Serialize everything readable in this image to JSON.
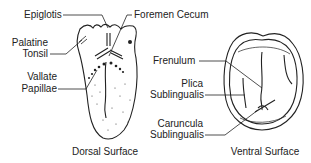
{
  "dorsal": {
    "caption": "Dorsal Surface",
    "labels": {
      "epiglotis": "Epiglotis",
      "foremen_cecum": "Foremen Cecum",
      "palatine_1": "Palatine",
      "palatine_2": "Tonsil",
      "vallate_1": "Vallate",
      "vallate_2": "Papillae"
    }
  },
  "ventral": {
    "caption": "Ventral Surface",
    "labels": {
      "frenulum": "Frenulum",
      "plica_1": "Plica",
      "plica_2": "Sublingualis",
      "caruncula_1": "Caruncula",
      "caruncula_2": "Sublingualis"
    }
  },
  "colors": {
    "ink": "#222222",
    "background": "#ffffff"
  }
}
